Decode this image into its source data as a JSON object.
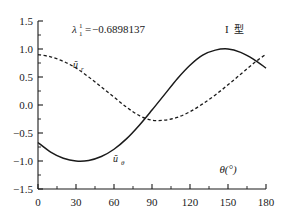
{
  "figure": {
    "background_color": "#ffffff",
    "ink_color": "#1a1a1a"
  },
  "annotations": {
    "eigenvalue": {
      "symbol": "λ",
      "superscript": "1",
      "subscript": "1",
      "equals": "=",
      "value": "−0.6898137",
      "full_text": "λ₁¹ = −0.6898137"
    },
    "type_label": {
      "roman": "I",
      "cjk": "型",
      "full_text": "I 型"
    }
  },
  "curve_labels": {
    "radial": {
      "base": "ũ",
      "subscript": "r",
      "full_text": "ũᵣ"
    },
    "tangential": {
      "base": "ũ",
      "subscript": "θ",
      "full_text": "ũθ"
    }
  },
  "axes": {
    "x": {
      "label": "θ(°)",
      "ticks": [
        "0",
        "30",
        "60",
        "90",
        "120",
        "150",
        "180"
      ],
      "min": 0,
      "max": 180,
      "minor_per_interval": 1
    },
    "y": {
      "label": "",
      "ticks": [
        "1.5",
        "1.0",
        "0.5",
        "0.0",
        "−0.5",
        "−1.0",
        "−1.5"
      ],
      "min": -1.5,
      "max": 1.5,
      "minor_per_interval": 1
    }
  },
  "chart_data": {
    "type": "line",
    "title": "",
    "subtitle": "",
    "xlabel": "θ(°)",
    "ylabel": "",
    "xlim": [
      0,
      180
    ],
    "ylim": [
      -1.5,
      1.5
    ],
    "grid": false,
    "legend": "inline-curve-labels",
    "xticks": [
      0,
      30,
      60,
      90,
      120,
      150,
      180
    ],
    "yticks": [
      -1.5,
      -1.0,
      -0.5,
      0.0,
      0.5,
      1.0,
      1.5
    ],
    "annotations": [
      {
        "text": "λ₁¹ = −0.6898137",
        "x": 45,
        "y": 1.33
      },
      {
        "text": "I 型",
        "x": 160,
        "y": 1.33
      },
      {
        "text": "ũᵣ",
        "x": 28,
        "y": 0.7
      },
      {
        "text": "ũθ",
        "x": 78,
        "y": -0.9
      }
    ],
    "x": [
      0,
      10,
      20,
      30,
      40,
      50,
      60,
      70,
      80,
      90,
      100,
      110,
      120,
      130,
      140,
      150,
      160,
      170,
      180
    ],
    "series": [
      {
        "name": "ũᵣ",
        "style": "dashed",
        "color": "#1a1a1a",
        "values": [
          0.9,
          0.86,
          0.78,
          0.66,
          0.5,
          0.32,
          0.14,
          -0.04,
          -0.19,
          -0.27,
          -0.27,
          -0.22,
          -0.12,
          0.02,
          0.18,
          0.36,
          0.55,
          0.74,
          0.91
        ]
      },
      {
        "name": "ũθ",
        "style": "solid",
        "color": "#1a1a1a",
        "values": [
          -0.67,
          -0.84,
          -0.95,
          -1.0,
          -0.99,
          -0.92,
          -0.79,
          -0.6,
          -0.36,
          -0.09,
          0.19,
          0.47,
          0.71,
          0.89,
          0.98,
          1.0,
          0.94,
          0.82,
          0.66
        ]
      }
    ]
  }
}
